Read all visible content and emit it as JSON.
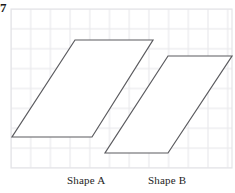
{
  "figure": {
    "corner_mark": "7",
    "background_color": "#ffffff",
    "grid": {
      "line_color": "#e9e9ec",
      "major_line_color": "#e2e2e6",
      "cell_size": 19.7,
      "left": 11,
      "top": 9,
      "right": 232,
      "bottom": 168,
      "columns": 11,
      "rows": 8
    },
    "shapes": [
      {
        "name": "Shape A",
        "label": "Shape A",
        "type": "parallelogram",
        "stroke_color": "#5b5b5f",
        "fill_color": "#ffffff",
        "stroke_width": 1.2,
        "points": "75,40 153,40 92,137 12,137",
        "vertices": [
          {
            "x": 75,
            "y": 40
          },
          {
            "x": 153,
            "y": 40
          },
          {
            "x": 92,
            "y": 137
          },
          {
            "x": 12,
            "y": 137
          }
        ],
        "base_length_px": 80,
        "height_px": 97
      },
      {
        "name": "Shape B",
        "label": "Shape B",
        "type": "parallelogram",
        "stroke_color": "#5b5b5f",
        "fill_color": "#ffffff",
        "stroke_width": 1.2,
        "points": "168,56 232,56 168,153 105,153",
        "vertices": [
          {
            "x": 168,
            "y": 56
          },
          {
            "x": 232,
            "y": 56
          },
          {
            "x": 168,
            "y": 153
          },
          {
            "x": 105,
            "y": 153
          }
        ],
        "base_length_px": 63,
        "height_px": 97
      }
    ],
    "labels": {
      "shape_a": "Shape A",
      "shape_b": "Shape B"
    }
  }
}
